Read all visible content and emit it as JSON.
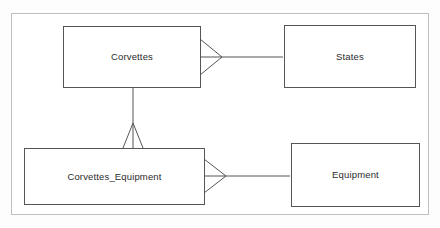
{
  "diagram": {
    "type": "entity-relationship-diagram",
    "canvas": {
      "width": 440,
      "height": 228,
      "background_color": "#ffffff",
      "frame_border_color": "#bfbfbf",
      "entity_border_color": "#555555",
      "connector_color": "#555555",
      "text_color": "#2b2b2b"
    },
    "entities": [
      {
        "id": "corvettes",
        "label": "Corvettes",
        "x": 62,
        "y": 26,
        "width": 138,
        "height": 62
      },
      {
        "id": "states",
        "label": "States",
        "x": 283,
        "y": 25,
        "width": 132,
        "height": 63
      },
      {
        "id": "corvettes_equipment",
        "label": "Corvettes_Equipment",
        "x": 23,
        "y": 148,
        "width": 181,
        "height": 57
      },
      {
        "id": "equipment",
        "label": "Equipment",
        "x": 290,
        "y": 143,
        "width": 129,
        "height": 64
      }
    ],
    "relationships": [
      {
        "id": "corvettes-states",
        "from": "Corvettes",
        "to": "States",
        "notation": "crow-foot",
        "cardinality": "many-to-one",
        "orientation": "horizontal",
        "many_end_at": "Corvettes"
      },
      {
        "id": "corvettes-corvettes_equipment",
        "from": "Corvettes",
        "to": "Corvettes_Equipment",
        "notation": "crow-foot",
        "cardinality": "one-to-many",
        "orientation": "vertical",
        "many_end_at": "Corvettes_Equipment"
      },
      {
        "id": "corvettes_equipment-equipment",
        "from": "Corvettes_Equipment",
        "to": "Equipment",
        "notation": "crow-foot",
        "cardinality": "many-to-one",
        "orientation": "horizontal",
        "many_end_at": "Corvettes_Equipment"
      }
    ]
  }
}
